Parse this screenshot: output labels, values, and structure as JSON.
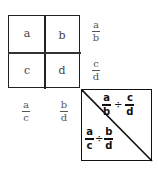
{
  "grid": {
    "cells": [
      "a",
      "b",
      "c",
      "d"
    ]
  },
  "row_fractions": [
    {
      "num": "a",
      "den": "b"
    },
    {
      "num": "c",
      "den": "d"
    }
  ],
  "col_fractions": [
    {
      "num": "a",
      "den": "c"
    },
    {
      "num": "b",
      "den": "d"
    }
  ],
  "triangle_box": {
    "upper": {
      "left": {
        "num": "a",
        "den": "b"
      },
      "op": "÷",
      "right": {
        "num": "c",
        "den": "d"
      }
    },
    "lower": {
      "left": {
        "num": "a",
        "den": "c"
      },
      "op": "÷",
      "right": {
        "num": "b",
        "den": "d"
      }
    }
  }
}
